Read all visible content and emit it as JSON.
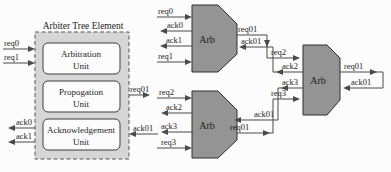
{
  "diagram": {
    "arbiter_tree_element": {
      "title": "Arbiter Tree Element",
      "units": [
        {
          "name": "Arbitration",
          "suffix": "Unit"
        },
        {
          "name": "Propogation",
          "suffix": "Unit"
        },
        {
          "name": "Acknowledgement",
          "suffix": "Unit"
        }
      ],
      "left_inputs": [
        "req0",
        "req1"
      ],
      "left_outputs": [
        "ack0",
        "ack1"
      ],
      "right_output": "req01",
      "right_input": "ack01"
    },
    "tree": {
      "top_arb": {
        "label": "Arb",
        "inputs": [
          "req0",
          "ack0",
          "ack1",
          "req1"
        ],
        "req_out": "req01",
        "ack_in": "ack01"
      },
      "bottom_arb": {
        "label": "Arb",
        "inputs": [
          "req2",
          "ack2",
          "ack3",
          "req3"
        ],
        "req_out": "req01",
        "ack_in": "ack01"
      },
      "root_arb": {
        "label": "Arb",
        "inputs": [
          "req2",
          "ack2",
          "ack3",
          "req3"
        ],
        "req_out": "req01",
        "ack_in": "ack01"
      }
    },
    "colors": {
      "arb_fill": "#949494",
      "element_fill": "#d6d6d6",
      "unit_fill": "#fcfcfc",
      "wire": "#4a4a4a",
      "background": "#fcfcfc"
    }
  }
}
